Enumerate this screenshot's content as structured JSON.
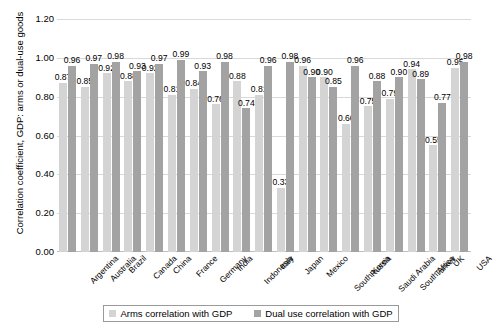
{
  "chart_data": {
    "type": "bar",
    "title": "",
    "xlabel": "",
    "ylabel": "Correlation coefficient, GDP: arms or dual-use goods",
    "ylim": [
      0.0,
      1.2
    ],
    "ytick_labels": [
      "1.20",
      "1.00",
      "0.80",
      "0.60",
      "0.40",
      "0.20",
      "0.00"
    ],
    "ytick_values": [
      1.2,
      1.0,
      0.8,
      0.6,
      0.4,
      0.2,
      0.0
    ],
    "grid": true,
    "legend_position": "bottom",
    "categories": [
      "Argentina",
      "Australia",
      "Brazil",
      "Canada",
      "China",
      "France",
      "Germany",
      "India",
      "Indonesia",
      "Italy",
      "Japan",
      "Mexico",
      "South Korea",
      "Russia",
      "Saudi Arabia",
      "South Africa",
      "Turkey",
      "UK",
      "USA"
    ],
    "series": [
      {
        "name": "Arms correlation with GDP",
        "color": "#d4d4d4",
        "values": [
          0.87,
          0.85,
          0.92,
          0.88,
          0.92,
          0.81,
          0.84,
          0.76,
          0.88,
          0.81,
          0.33,
          0.96,
          0.9,
          0.66,
          0.75,
          0.79,
          0.94,
          0.55,
          0.95
        ],
        "labels": [
          "0.87",
          "0.85",
          "0.92",
          "0.88",
          "0.92",
          "0.81",
          "0.84",
          "0.76",
          "0.88",
          "0.81",
          "0.33",
          "0.96",
          "0.90",
          "0.66",
          "0.75",
          "0.79",
          "0.94",
          "0.55",
          "0.95"
        ]
      },
      {
        "name": "Dual use correlation with GDP",
        "color": "#a3a3a3",
        "values": [
          0.96,
          0.97,
          0.98,
          0.93,
          0.97,
          0.99,
          0.93,
          0.98,
          0.74,
          0.96,
          0.98,
          0.9,
          0.85,
          0.96,
          0.88,
          0.9,
          0.89,
          0.77,
          0.98
        ],
        "labels": [
          "0.96",
          "0.97",
          "0.98",
          "0.93",
          "0.97",
          "0.99",
          "0.93",
          "0.98",
          "0.74",
          "0.96",
          "0.98",
          "0.90",
          "0.85",
          "0.96",
          "0.88",
          "0.90",
          "0.89",
          "0.77",
          "0.98"
        ]
      }
    ]
  },
  "legend": {
    "items": [
      {
        "label": "Arms correlation with GDP",
        "color": "#d4d4d4"
      },
      {
        "label": "Dual use correlation with GDP",
        "color": "#a3a3a3"
      }
    ]
  }
}
